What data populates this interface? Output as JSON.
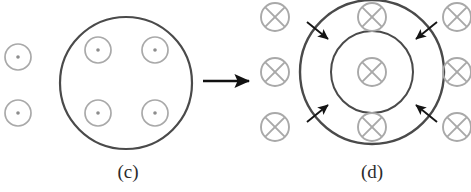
{
  "figure": {
    "type": "physics-diagram",
    "background_color": "#ffffff",
    "stroke_dark": "#3a3a3a",
    "stroke_light": "#a9a9a9",
    "arrow_color": "#111111"
  },
  "panels": [
    {
      "id": "c",
      "caption": "(c)",
      "field_symbol": "dot",
      "field_symbol_name": "field-out-of-page",
      "main_circle": {
        "cx": 126,
        "cy": 83,
        "r": 66,
        "stroke_width": 2.2
      },
      "inside_symbols": [
        {
          "cx": 98,
          "cy": 50,
          "r": 13
        },
        {
          "cx": 155,
          "cy": 50,
          "r": 13
        },
        {
          "cx": 98,
          "cy": 113,
          "r": 13
        },
        {
          "cx": 155,
          "cy": 113,
          "r": 13
        }
      ],
      "outside_symbols": [
        {
          "cx": 18,
          "cy": 57,
          "r": 13
        },
        {
          "cx": 18,
          "cy": 113,
          "r": 13
        }
      ],
      "symbol_dot_radius": 1.8
    },
    {
      "id": "d",
      "caption": "(d)",
      "field_symbol": "cross",
      "field_symbol_name": "field-into-page",
      "outer_circle": {
        "cx": 372,
        "cy": 72,
        "r": 72,
        "stroke_width": 2.4
      },
      "inner_circle": {
        "cx": 372,
        "cy": 72,
        "r": 41,
        "stroke_width": 2.0
      },
      "inside_symbols": [
        {
          "cx": 372,
          "cy": 72,
          "r": 14
        },
        {
          "cx": 372,
          "cy": 17,
          "r": 14
        },
        {
          "cx": 372,
          "cy": 127,
          "r": 14
        }
      ],
      "outside_symbols": [
        {
          "cx": 275,
          "cy": 17,
          "r": 14
        },
        {
          "cx": 275,
          "cy": 72,
          "r": 14
        },
        {
          "cx": 275,
          "cy": 127,
          "r": 14
        },
        {
          "cx": 457,
          "cy": 17,
          "r": 14
        },
        {
          "cx": 457,
          "cy": 72,
          "r": 14
        },
        {
          "cx": 457,
          "cy": 127,
          "r": 14
        }
      ],
      "contraction_arrows": [
        {
          "name": "arrow-top-left-inward",
          "x1": 307,
          "y1": 22,
          "x2": 330,
          "y2": 41
        },
        {
          "name": "arrow-top-right-inward",
          "x1": 437,
          "y1": 22,
          "x2": 414,
          "y2": 41
        },
        {
          "name": "arrow-bottom-left-inward",
          "x1": 307,
          "y1": 122,
          "x2": 330,
          "y2": 103
        },
        {
          "name": "arrow-bottom-right-inward",
          "x1": 437,
          "y1": 122,
          "x2": 414,
          "y2": 103
        }
      ]
    }
  ],
  "transition_arrow": {
    "name": "transition-arrow",
    "x1": 203,
    "y1": 81,
    "x2": 251,
    "y2": 81,
    "stroke_width": 2.6
  }
}
